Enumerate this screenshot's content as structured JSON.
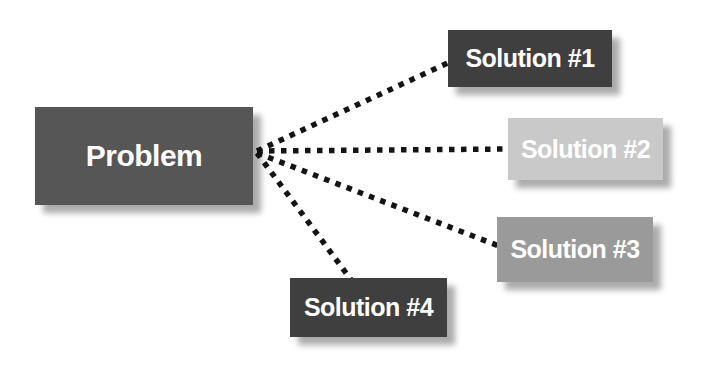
{
  "diagram": {
    "background_color": "#ffffff",
    "connector_color": "#141414",
    "connector_style": "dotted-square",
    "nodes": {
      "problem": {
        "label": "Problem",
        "fill": "#565656",
        "text_color": "#ffffff"
      },
      "solution1": {
        "label": "Solution #1",
        "fill": "#3f3f3f",
        "text_color": "#ffffff"
      },
      "solution2": {
        "label": "Solution #2",
        "fill": "#c9c9c9",
        "text_color": "#ffffff"
      },
      "solution3": {
        "label": "Solution #3",
        "fill": "#9a9a9a",
        "text_color": "#ffffff"
      },
      "solution4": {
        "label": "Solution #4",
        "fill": "#3f3f3f",
        "text_color": "#ffffff"
      }
    },
    "edges": [
      {
        "from": "problem",
        "to": "solution1"
      },
      {
        "from": "problem",
        "to": "solution2"
      },
      {
        "from": "problem",
        "to": "solution3"
      },
      {
        "from": "problem",
        "to": "solution4"
      }
    ]
  }
}
